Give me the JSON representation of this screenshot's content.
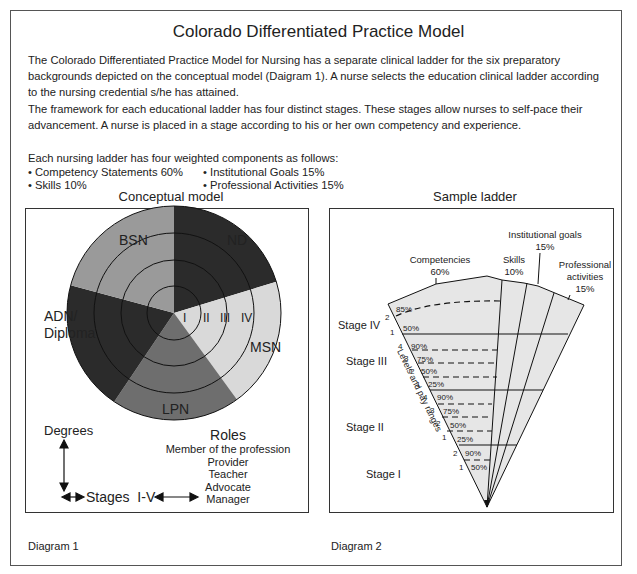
{
  "title": "Colorado Differentiated Practice Model",
  "intro": {
    "paragraph1": "The Colorado Differentiated Practice Model for Nursing has a separate clinical ladder for the six preparatory backgrounds depicted on the conceptual model (Daigram 1).  A nurse selects the education clinical ladder according to the nursing credential s/he has attained.",
    "paragraph2": "The framework for each educational ladder has four distinct stages.  These stages allow nurses to self-pace their advancement.  A nurse is placed in a stage according to his or her own competency and experience.",
    "components_heading": "Each nursing ladder has four weighted components as follows:",
    "components": [
      "• Competency Statements 60%",
      "• Skills 10%",
      "• Institutional Goals 15%",
      "• Professional Activities 15%"
    ]
  },
  "diagram1": {
    "heading": "Conceptual model",
    "caption": "Diagram 1",
    "sectors": [
      {
        "label": "ND",
        "color": "#2b2b2b"
      },
      {
        "label": "MSN",
        "color": "#d9d9d9"
      },
      {
        "label": "LPN",
        "color": "#6e6e6e"
      },
      {
        "label": "ADN/",
        "label2": "Diploma",
        "color": "#2b2b2b"
      },
      {
        "label": "BSN",
        "color": "#9a9a9a"
      }
    ],
    "rings": [
      "I",
      "II",
      "III",
      "IV"
    ],
    "axes": {
      "degrees": "Degrees",
      "stages": "Stages  I-V"
    },
    "roles": {
      "heading": "Roles",
      "items": [
        "Member of the profession",
        "Provider",
        "Teacher",
        "Advocate",
        "Manager"
      ]
    }
  },
  "diagram2": {
    "heading": "Sample ladder",
    "caption": "Diagram 2",
    "components": {
      "competencies": {
        "label": "Competencies",
        "pct": "60%"
      },
      "skills": {
        "label": "Skills",
        "pct": "10%"
      },
      "institutional": {
        "label": "Institutional goals",
        "pct": "15%"
      },
      "professional": {
        "label1": "Professional",
        "label2": "activities",
        "pct": "15%"
      }
    },
    "side_label": "Levels and pay ranges",
    "stages": [
      {
        "name": "Stage IV",
        "levels": [
          {
            "n": "2",
            "pct": "85%"
          },
          {
            "n": "1",
            "pct": "50%"
          }
        ]
      },
      {
        "name": "Stage III",
        "levels": [
          {
            "n": "4",
            "pct": "90%"
          },
          {
            "n": "3",
            "pct": "75%"
          },
          {
            "n": "2",
            "pct": "50%"
          },
          {
            "n": "1",
            "pct": "25%"
          }
        ]
      },
      {
        "name": "Stage II",
        "levels": [
          {
            "n": "4",
            "pct": "90%"
          },
          {
            "n": "3",
            "pct": "75%"
          },
          {
            "n": "2",
            "pct": "50%"
          },
          {
            "n": "1",
            "pct": "25%"
          }
        ]
      },
      {
        "name": "Stage I",
        "levels": [
          {
            "n": "2",
            "pct": "90%"
          },
          {
            "n": "1",
            "pct": "50%"
          }
        ]
      }
    ],
    "fill_color": "#e6e6e6"
  }
}
